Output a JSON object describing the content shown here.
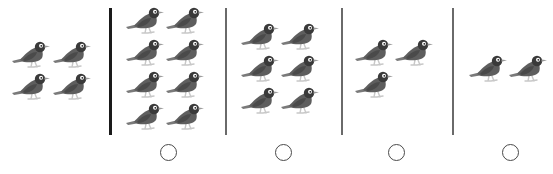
{
  "worksheet": {
    "instruction_hidden": "Compare each group with the reference group of birds",
    "reference_group": {
      "label": "reference-group",
      "bird_count": 4,
      "birds": [
        {
          "x": 10,
          "y": 40
        },
        {
          "x": 51,
          "y": 40
        },
        {
          "x": 10,
          "y": 72
        },
        {
          "x": 51,
          "y": 72
        }
      ]
    },
    "dividers": [
      {
        "x": 109,
        "top": 8,
        "bottom": 135,
        "style": "thick",
        "color": "#1a1a1a"
      },
      {
        "x": 225,
        "top": 8,
        "bottom": 135,
        "style": "thin",
        "color": "#6a6a6a"
      },
      {
        "x": 341,
        "top": 8,
        "bottom": 135,
        "style": "thin",
        "color": "#6a6a6a"
      },
      {
        "x": 452,
        "top": 8,
        "bottom": 135,
        "style": "thin",
        "color": "#6a6a6a"
      }
    ],
    "options": [
      {
        "label": "group-a",
        "bird_count": 8,
        "circle": {
          "cx": 168,
          "cy": 152,
          "selected": false
        },
        "birds": [
          {
            "x": 124,
            "y": 6
          },
          {
            "x": 164,
            "y": 6
          },
          {
            "x": 124,
            "y": 38
          },
          {
            "x": 164,
            "y": 38
          },
          {
            "x": 124,
            "y": 70
          },
          {
            "x": 164,
            "y": 70
          },
          {
            "x": 124,
            "y": 102
          },
          {
            "x": 164,
            "y": 102
          }
        ]
      },
      {
        "label": "group-b",
        "bird_count": 6,
        "circle": {
          "cx": 283,
          "cy": 152,
          "selected": false
        },
        "birds": [
          {
            "x": 239,
            "y": 22
          },
          {
            "x": 279,
            "y": 22
          },
          {
            "x": 239,
            "y": 54
          },
          {
            "x": 279,
            "y": 54
          },
          {
            "x": 239,
            "y": 86
          },
          {
            "x": 279,
            "y": 86
          }
        ]
      },
      {
        "label": "group-c",
        "bird_count": 3,
        "circle": {
          "cx": 396,
          "cy": 152,
          "selected": false
        },
        "birds": [
          {
            "x": 353,
            "y": 38
          },
          {
            "x": 393,
            "y": 38
          },
          {
            "x": 353,
            "y": 70
          }
        ]
      },
      {
        "label": "group-d",
        "bird_count": 2,
        "circle": {
          "cx": 510,
          "cy": 152,
          "selected": false
        },
        "birds": [
          {
            "x": 467,
            "y": 54
          },
          {
            "x": 507,
            "y": 54
          }
        ]
      }
    ],
    "colors": {
      "bird_body": "#5e5e5e",
      "bird_wing": "#4a4a4a",
      "bird_head": "#3a3a3a",
      "bird_tail": "#7a7a7a",
      "bird_legs": "#c8c8c8",
      "eye_ring": "#ffffff",
      "beak": "#9a9a9a"
    },
    "icons": {
      "bird": "bird-icon",
      "circle": "answer-circle"
    }
  }
}
